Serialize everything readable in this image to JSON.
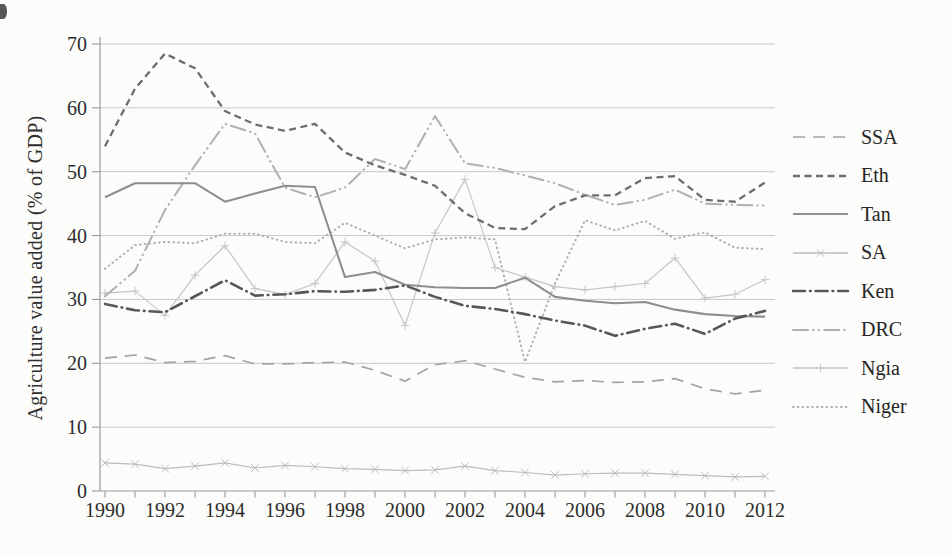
{
  "figure": {
    "background": "#fcfcfa"
  },
  "chart_data": {
    "type": "line",
    "title": "",
    "ylabel": "Agriculture value added (% of GDP)",
    "xlabel": "",
    "ylim": [
      0,
      70
    ],
    "yticks": [
      0,
      10,
      20,
      30,
      40,
      50,
      60,
      70
    ],
    "x": [
      1990,
      1991,
      1992,
      1993,
      1994,
      1995,
      1996,
      1997,
      1998,
      1999,
      2000,
      2001,
      2002,
      2003,
      2004,
      2005,
      2006,
      2007,
      2008,
      2009,
      2010,
      2011,
      2012
    ],
    "xticks": [
      1990,
      1992,
      1994,
      1996,
      1998,
      2000,
      2002,
      2004,
      2006,
      2008,
      2010,
      2012
    ],
    "grid": "horizontal",
    "legend_position": "right-outside",
    "axis_color": "#9a9a9a",
    "grid_color": "#c2c2c2",
    "text_color": "#2d2d2d",
    "series": [
      {
        "name": "SSA",
        "style": "long-dash",
        "color": "#a4a4a4",
        "width": 1.7,
        "marker": "none",
        "z": 5,
        "values": [
          20.8,
          21.3,
          20.1,
          20.3,
          21.2,
          19.9,
          19.9,
          20.1,
          20.2,
          18.9,
          17.2,
          19.8,
          20.4,
          19.1,
          17.8,
          17.1,
          17.3,
          17.0,
          17.1,
          17.6,
          16.0,
          15.2,
          15.8
        ]
      },
      {
        "name": "Eth",
        "style": "dash",
        "color": "#6d6d6d",
        "width": 2.3,
        "marker": "none",
        "z": 7,
        "values": [
          54.0,
          63.0,
          68.5,
          66.2,
          59.5,
          57.4,
          56.4,
          57.5,
          53.0,
          51.0,
          49.5,
          47.8,
          43.5,
          41.2,
          41.0,
          44.6,
          46.3,
          46.3,
          49.0,
          49.3,
          45.6,
          45.3,
          48.3
        ]
      },
      {
        "name": "Tan",
        "style": "solid",
        "color": "#8f8f8f",
        "width": 2.1,
        "marker": "none",
        "z": 6,
        "values": [
          46.0,
          48.2,
          48.2,
          48.2,
          45.3,
          46.6,
          47.8,
          47.6,
          33.5,
          34.3,
          32.3,
          31.9,
          31.8,
          31.8,
          33.4,
          30.4,
          29.8,
          29.4,
          29.6,
          28.4,
          27.7,
          27.4,
          27.3
        ]
      },
      {
        "name": "SA",
        "style": "solid",
        "color": "#bcbcbc",
        "width": 1.2,
        "marker": "x",
        "z": 1,
        "values": [
          4.4,
          4.2,
          3.5,
          3.9,
          4.4,
          3.6,
          4.0,
          3.8,
          3.5,
          3.4,
          3.2,
          3.3,
          3.9,
          3.2,
          2.9,
          2.5,
          2.7,
          2.8,
          2.8,
          2.6,
          2.4,
          2.2,
          2.3
        ]
      },
      {
        "name": "Ken",
        "style": "dash-dot",
        "color": "#575757",
        "width": 2.6,
        "marker": "none",
        "z": 8,
        "values": [
          29.3,
          28.3,
          28.0,
          30.5,
          33.0,
          30.6,
          30.8,
          31.3,
          31.2,
          31.5,
          32.2,
          30.4,
          29.0,
          28.5,
          27.7,
          26.7,
          25.9,
          24.3,
          25.4,
          26.2,
          24.6,
          27.0,
          28.2
        ]
      },
      {
        "name": "DRC",
        "style": "long-dash-dot-dot",
        "color": "#b0b0b0",
        "width": 2.0,
        "marker": "none",
        "z": 4,
        "values": [
          30.5,
          34.5,
          44.0,
          51.0,
          57.5,
          56.0,
          47.5,
          46.0,
          47.5,
          52.0,
          50.4,
          58.7,
          51.3,
          50.6,
          49.4,
          48.2,
          46.4,
          44.8,
          45.6,
          47.2,
          45.0,
          44.8,
          44.7
        ]
      },
      {
        "name": "Ngia",
        "style": "solid",
        "color": "#c6c6c6",
        "width": 1.2,
        "marker": "plus",
        "z": 2,
        "values": [
          31.0,
          31.3,
          27.5,
          33.8,
          38.4,
          31.7,
          30.8,
          32.5,
          39.0,
          36.0,
          25.9,
          40.4,
          48.8,
          35.0,
          33.5,
          32.0,
          31.5,
          32.0,
          32.5,
          36.5,
          30.2,
          30.8,
          33.1
        ]
      },
      {
        "name": "Niger",
        "style": "dotted",
        "color": "#aeaeae",
        "width": 2.0,
        "marker": "none",
        "z": 3,
        "values": [
          34.8,
          38.5,
          39.0,
          38.8,
          40.3,
          40.3,
          39.0,
          38.8,
          42.0,
          40.0,
          38.0,
          39.4,
          39.7,
          39.4,
          20.2,
          32.5,
          42.4,
          40.8,
          42.3,
          39.5,
          40.5,
          38.1,
          37.9
        ]
      }
    ]
  }
}
